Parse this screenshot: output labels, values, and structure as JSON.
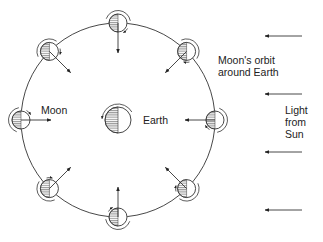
{
  "labels": {
    "orbit_line1": "Moon's orbit",
    "orbit_line2": "around Earth",
    "light_line1": "Light",
    "light_line2": "from",
    "light_line3": "Sun",
    "moon": "Moon",
    "earth": "Earth"
  },
  "geometry": {
    "orbit": {
      "cx": 118,
      "cy": 120,
      "r": 97
    },
    "earth": {
      "cx": 118,
      "cy": 120,
      "r": 13
    },
    "moon_r": 9,
    "moons": [
      {
        "angle": 90
      },
      {
        "angle": 45
      },
      {
        "angle": 0
      },
      {
        "angle": -45
      },
      {
        "angle": -90
      },
      {
        "angle": -135
      },
      {
        "angle": 180
      },
      {
        "angle": 135
      }
    ],
    "sun_arrows_y": [
      36,
      94,
      152,
      210
    ],
    "sun_arrow_x1": 302,
    "sun_arrow_x2": 265
  },
  "colors": {
    "line": "#333333",
    "hatch": "#444444",
    "background": "#ffffff"
  }
}
